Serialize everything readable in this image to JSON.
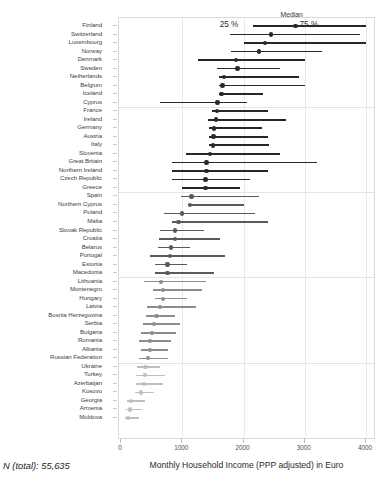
{
  "chart_data": {
    "type": "bar",
    "subtype": "dot-and-whisker-quantile-plot",
    "title": "",
    "xlabel": "Monthly Household Income (PPP adjusted) in Euro",
    "ylabel": "",
    "xlim": [
      0,
      4200
    ],
    "xticks": [
      0,
      1000,
      2000,
      3000,
      4000
    ],
    "xticklabels": [
      "0",
      "1000",
      "2000",
      "3000",
      "4000"
    ],
    "grid": "vertical-only",
    "legend": {
      "median_label": "Median",
      "p25_label": "25 %",
      "p75_label": "75 %",
      "position": "top-inside"
    },
    "annotation_n_total": "N (total): 55,635",
    "series_keys": [
      "p25",
      "median",
      "p75"
    ],
    "group_separators_after": [
      "Cyprus",
      "Greece",
      "Macedonia",
      "Russian Federation"
    ],
    "categories": [
      "Finland",
      "Switzerland",
      "Luxembourg",
      "Norway",
      "Denmark",
      "Sweden",
      "Netherlands",
      "Belgium",
      "Iceland",
      "Cyprus",
      "France",
      "Ireland",
      "Germany",
      "Austria",
      "Italy",
      "Slovenia",
      "Great Britain",
      "Northern Ireland",
      "Czech Republic",
      "Greece",
      "Spain",
      "Northern Cyprus",
      "Poland",
      "Malta",
      "Slovak Republic",
      "Croatia",
      "Belarus",
      "Portugal",
      "Estonia",
      "Macedonia",
      "Lithuania",
      "Montenegro",
      "Hungary",
      "Latvia",
      "Bosnia Herzegovina",
      "Serbia",
      "Bulgaria",
      "Romania",
      "Albania",
      "Russian Federation",
      "Ukraine",
      "Turkey",
      "Azerbaijan",
      "Kosovo",
      "Georgia",
      "Armenia",
      "Moldova"
    ],
    "rows": [
      {
        "country": "Finland",
        "p25": 2150,
        "median": 2850,
        "p75": 4000
      },
      {
        "country": "Switzerland",
        "p25": 1780,
        "median": 2450,
        "p75": 3900
      },
      {
        "country": "Luxembourg",
        "p25": 2000,
        "median": 2350,
        "p75": 4000
      },
      {
        "country": "Norway",
        "p25": 1800,
        "median": 2250,
        "p75": 3280
      },
      {
        "country": "Denmark",
        "p25": 1250,
        "median": 1880,
        "p75": 3000
      },
      {
        "country": "Sweden",
        "p25": 1560,
        "median": 1900,
        "p75": 2600
      },
      {
        "country": "Netherlands",
        "p25": 1600,
        "median": 1680,
        "p75": 2900
      },
      {
        "country": "Belgium",
        "p25": 1600,
        "median": 1660,
        "p75": 3000
      },
      {
        "country": "Iceland",
        "p25": 1600,
        "median": 1640,
        "p75": 2320
      },
      {
        "country": "Cyprus",
        "p25": 640,
        "median": 1580,
        "p75": 2050
      },
      {
        "country": "France",
        "p25": 1480,
        "median": 1570,
        "p75": 2400
      },
      {
        "country": "Ireland",
        "p25": 1420,
        "median": 1550,
        "p75": 2700
      },
      {
        "country": "Germany",
        "p25": 1440,
        "median": 1520,
        "p75": 2300
      },
      {
        "country": "Austria",
        "p25": 1440,
        "median": 1510,
        "p75": 2400
      },
      {
        "country": "Italy",
        "p25": 1440,
        "median": 1500,
        "p75": 2420
      },
      {
        "country": "Slovenia",
        "p25": 1060,
        "median": 1450,
        "p75": 2600
      },
      {
        "country": "Great Britain",
        "p25": 830,
        "median": 1400,
        "p75": 3200
      },
      {
        "country": "Northern Ireland",
        "p25": 840,
        "median": 1400,
        "p75": 2400
      },
      {
        "country": "Czech Republic",
        "p25": 840,
        "median": 1380,
        "p75": 2100
      },
      {
        "country": "Greece",
        "p25": 1000,
        "median": 1380,
        "p75": 1950
      },
      {
        "country": "Spain",
        "p25": 980,
        "median": 1150,
        "p75": 2250
      },
      {
        "country": "Northern Cyprus",
        "p25": 1100,
        "median": 1130,
        "p75": 2000
      },
      {
        "country": "Poland",
        "p25": 700,
        "median": 1000,
        "p75": 2180
      },
      {
        "country": "Malta",
        "p25": 840,
        "median": 940,
        "p75": 2400
      },
      {
        "country": "Slovak Republic",
        "p25": 630,
        "median": 880,
        "p75": 1350
      },
      {
        "country": "Croatia",
        "p25": 620,
        "median": 880,
        "p75": 1620
      },
      {
        "country": "Belarus",
        "p25": 600,
        "median": 820,
        "p75": 1130
      },
      {
        "country": "Portugal",
        "p25": 480,
        "median": 800,
        "p75": 1700
      },
      {
        "country": "Estonia",
        "p25": 560,
        "median": 760,
        "p75": 1080
      },
      {
        "country": "Macedonia",
        "p25": 560,
        "median": 760,
        "p75": 1520
      },
      {
        "country": "Lithuania",
        "p25": 380,
        "median": 650,
        "p75": 1380
      },
      {
        "country": "Montenegro",
        "p25": 520,
        "median": 680,
        "p75": 1320
      },
      {
        "country": "Hungary",
        "p25": 560,
        "median": 680,
        "p75": 1080
      },
      {
        "country": "Latvia",
        "p25": 420,
        "median": 640,
        "p75": 1220
      },
      {
        "country": "Bosnia Herzegovina",
        "p25": 400,
        "median": 580,
        "p75": 880
      },
      {
        "country": "Serbia",
        "p25": 360,
        "median": 540,
        "p75": 960
      },
      {
        "country": "Bulgaria",
        "p25": 330,
        "median": 500,
        "p75": 900
      },
      {
        "country": "Romania",
        "p25": 300,
        "median": 480,
        "p75": 820
      },
      {
        "country": "Albania",
        "p25": 320,
        "median": 470,
        "p75": 760
      },
      {
        "country": "Russian Federation",
        "p25": 290,
        "median": 440,
        "p75": 760
      },
      {
        "country": "Ukraine",
        "p25": 260,
        "median": 400,
        "p75": 640
      },
      {
        "country": "Turkey",
        "p25": 250,
        "median": 390,
        "p75": 720
      },
      {
        "country": "Azerbaijan",
        "p25": 240,
        "median": 380,
        "p75": 690
      },
      {
        "country": "Kosovo",
        "p25": 230,
        "median": 330,
        "p75": 540
      },
      {
        "country": "Georgia",
        "p25": 90,
        "median": 160,
        "p75": 400
      },
      {
        "country": "Armenia",
        "p25": 80,
        "median": 150,
        "p75": 350
      },
      {
        "country": "Moldova",
        "p25": 60,
        "median": 120,
        "p75": 300
      }
    ]
  },
  "colors": {
    "dark": "#272727",
    "mid": "#5a5a5a",
    "light": "#a8a8a8",
    "lighter": "#bfbfbf",
    "frame": "#d9d9d9",
    "grid": "#e9e9e9",
    "text": "#3d3d3d"
  }
}
